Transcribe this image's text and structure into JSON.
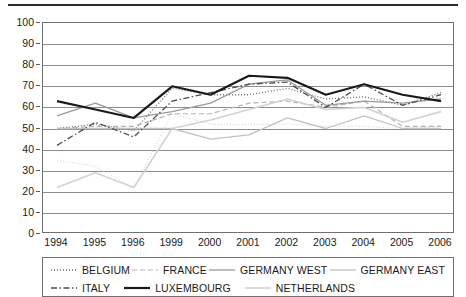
{
  "chart_data": {
    "type": "line",
    "title": "",
    "xlabel": "",
    "ylabel": "",
    "ylim": [
      0,
      100
    ],
    "ytick_step": 10,
    "grid": true,
    "legend_position": "bottom",
    "categories": [
      "1994",
      "1995",
      "1996",
      "1999",
      "2000",
      "2001",
      "2002",
      "2003",
      "2004",
      "2005",
      "2006"
    ],
    "yticks": [
      "100",
      "90",
      "80",
      "70",
      "60",
      "50",
      "40",
      "30",
      "20",
      "10",
      "0"
    ],
    "series": [
      {
        "name": "BELGIUM",
        "style": "dotted",
        "color": "#6e6e6e",
        "width": 1.3,
        "values": [
          50,
          52,
          49,
          69,
          66,
          66,
          69,
          64,
          65,
          61,
          67
        ]
      },
      {
        "name": "FRANCE",
        "style": "dashed",
        "color": "#b4b4b4",
        "width": 1.2,
        "values": [
          50,
          51,
          51,
          57,
          57,
          62,
          63,
          60,
          63,
          51,
          51
        ]
      },
      {
        "name": "GERMANY WEST",
        "style": "solid",
        "color": "#9a9a9a",
        "width": 1.3,
        "values": [
          56,
          62,
          55,
          58,
          62,
          71,
          73,
          61,
          63,
          62,
          64
        ]
      },
      {
        "name": "GERMANY EAST",
        "style": "solid",
        "color": "#c2c2c2",
        "width": 1.3,
        "values": [
          50,
          50,
          50,
          50,
          45,
          47,
          55,
          50,
          56,
          50,
          50
        ]
      },
      {
        "name": "ITALY",
        "style": "dashdot",
        "color": "#4d4d4d",
        "width": 1.3,
        "values": [
          42,
          53,
          46,
          63,
          67,
          71,
          72,
          60,
          71,
          61,
          66
        ]
      },
      {
        "name": "LUXEMBOURG",
        "style": "solid",
        "color": "#1a1a1a",
        "width": 2.2,
        "values": [
          63,
          59,
          55,
          70,
          66,
          75,
          74,
          66,
          71,
          66,
          63
        ]
      },
      {
        "name": "NETHERLANDS",
        "style": "solid",
        "color": "#d2d2d2",
        "width": 1.6,
        "values": [
          22,
          29,
          22,
          50,
          54,
          59,
          64,
          59,
          60,
          53,
          58
        ]
      }
    ],
    "extra_series": [
      {
        "name": "BELGIUM-LOW",
        "style": "dotted",
        "color": "#d8d8d8",
        "width": 1.2,
        "values": [
          35,
          32,
          22,
          57,
          52,
          52,
          52,
          51,
          51,
          50,
          51
        ]
      }
    ]
  }
}
